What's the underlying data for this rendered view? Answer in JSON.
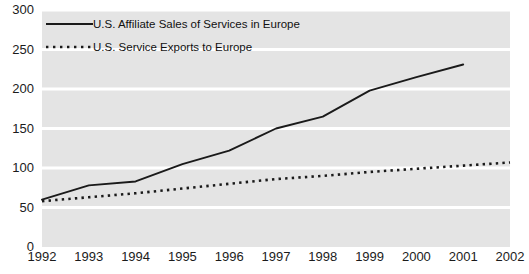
{
  "chart_data": {
    "type": "line",
    "title": "",
    "subtitle": "",
    "xlabel": "",
    "ylabel": "",
    "x": [
      1992,
      1993,
      1994,
      1995,
      1996,
      1997,
      1998,
      1999,
      2000,
      2001,
      2002
    ],
    "x_tick_labels": [
      "1992",
      "1993",
      "1994",
      "1995",
      "1996",
      "1997",
      "1998",
      "1999",
      "2000",
      "2001",
      "2002"
    ],
    "y_tick_labels": [
      "0",
      "50",
      "100",
      "150",
      "200",
      "250",
      "300"
    ],
    "y_ticks": [
      0,
      50,
      100,
      150,
      200,
      250,
      300
    ],
    "ylim": [
      0,
      300
    ],
    "xlim": [
      1992,
      2002
    ],
    "grid": true,
    "grid_style": "alternating-horizontal-bands",
    "legend_position": "top-left-inside",
    "series": [
      {
        "name": "U.S. Affiliate Sales of Services in Europe",
        "style": "solid",
        "color": "#1a1a1a",
        "values": [
          60,
          78,
          83,
          105,
          122,
          150,
          165,
          198,
          215,
          231,
          null
        ]
      },
      {
        "name": "U.S. Service Exports to Europe",
        "style": "dotted",
        "color": "#1a1a1a",
        "values": [
          58,
          63,
          68,
          74,
          80,
          86,
          90,
          95,
          99,
          103,
          107
        ]
      }
    ]
  },
  "legend": {
    "items": [
      {
        "label": "U.S. Affiliate Sales of Services in Europe",
        "style": "solid"
      },
      {
        "label": "U.S. Service Exports to Europe",
        "style": "dotted"
      }
    ]
  },
  "colors": {
    "band_light": "#e4e4e4",
    "band_white": "#ffffff",
    "line": "#1a1a1a",
    "text": "#1b1b1b",
    "background": "#ffffff"
  }
}
